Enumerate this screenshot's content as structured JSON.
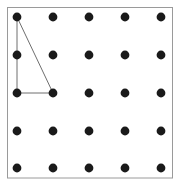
{
  "figure": {
    "type": "diagram",
    "canvas": {
      "width": 180,
      "height": 187,
      "background": "#ffffff"
    },
    "frame": {
      "name": "plot-border",
      "x": 7.5,
      "y": 7.5,
      "width": 165,
      "height": 170.5,
      "stroke": "#9a9a9a",
      "stroke_width": 1,
      "fill": "#ffffff"
    },
    "grid": {
      "rows": 5,
      "cols": 5,
      "x_positions": [
        17,
        53,
        89,
        125,
        161
      ],
      "y_positions": [
        17,
        55,
        93,
        131,
        168
      ],
      "dot_radius": 4.4,
      "dot_color": "#1a1a1a",
      "description": "5 by 5 array of evenly spaced lattice points"
    },
    "shape": {
      "name": "right-triangle",
      "stroke": "#6e6e6e",
      "stroke_width": 1,
      "fill": "none",
      "vertices": [
        {
          "label": "A",
          "col": 0,
          "row": 0,
          "x": 17,
          "y": 17
        },
        {
          "label": "B",
          "col": 0,
          "row": 2,
          "x": 17,
          "y": 93
        },
        {
          "label": "C",
          "col": 1,
          "row": 2,
          "x": 53,
          "y": 93
        }
      ],
      "edges": [
        {
          "name": "vertical-leg",
          "from": "A",
          "to": "B"
        },
        {
          "name": "horizontal-leg",
          "from": "B",
          "to": "C"
        },
        {
          "name": "hypotenuse",
          "from": "C",
          "to": "A"
        }
      ]
    }
  }
}
